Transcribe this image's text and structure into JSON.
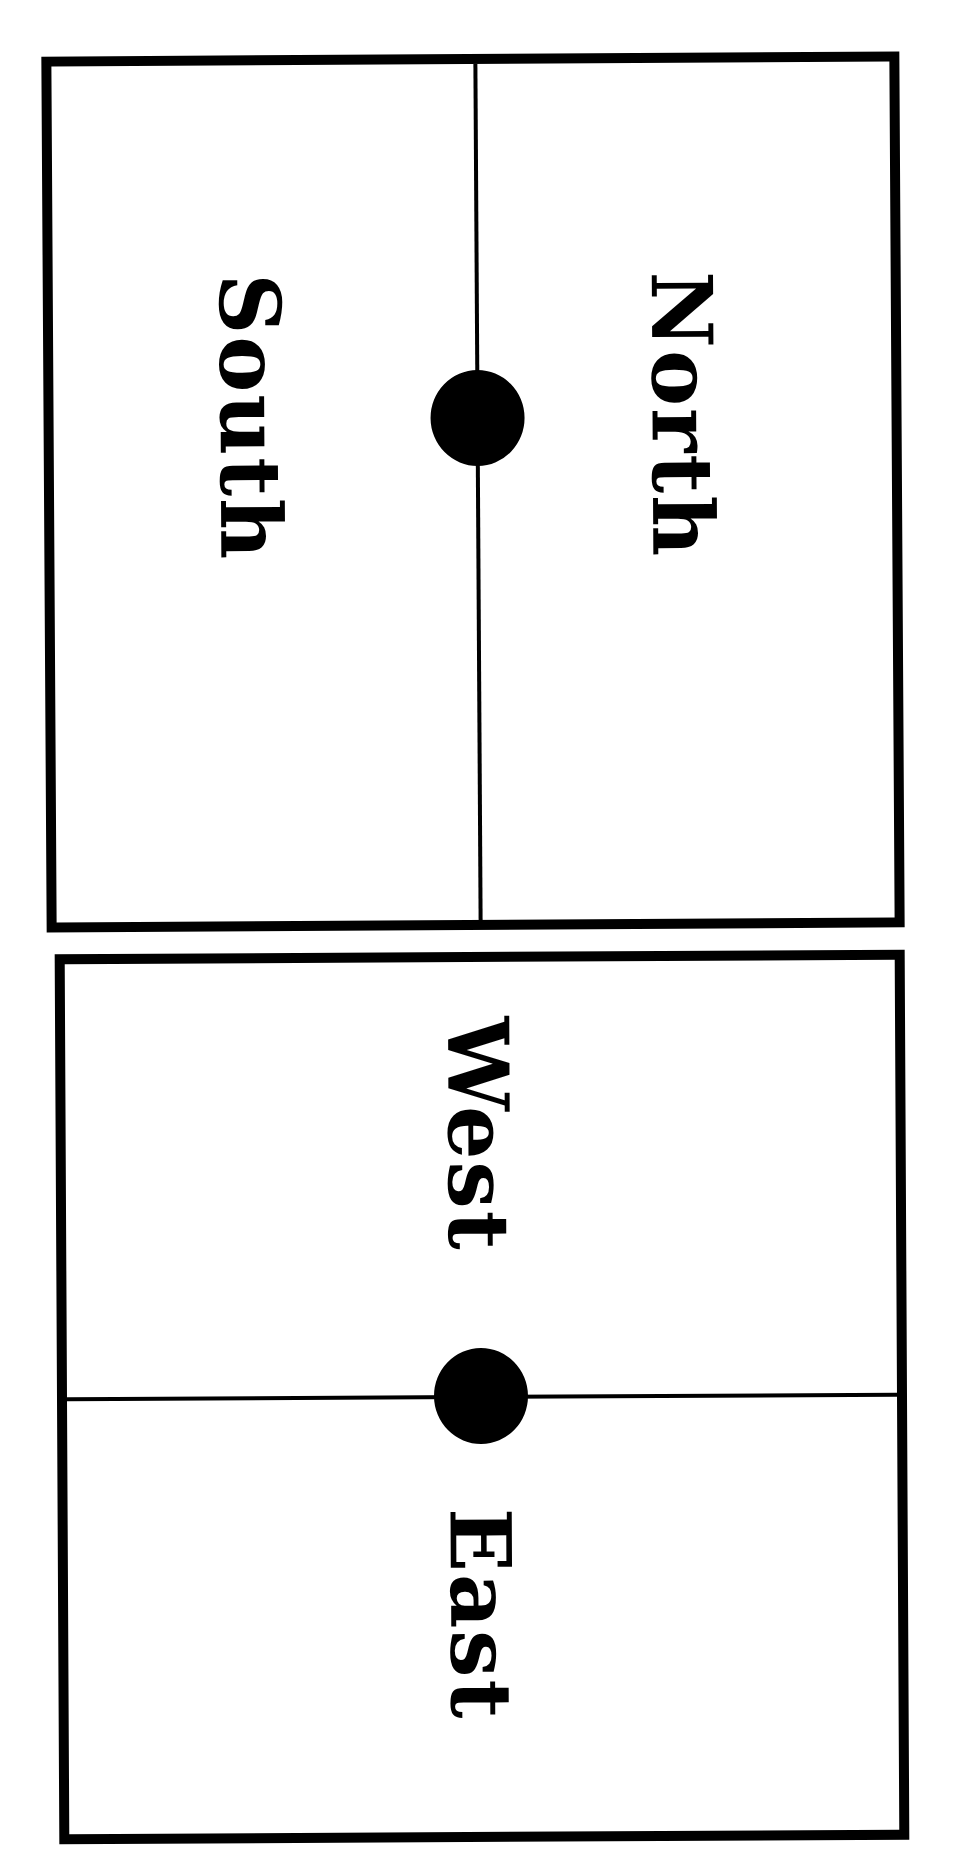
{
  "colors": {
    "line": "#000000",
    "background": "#ffffff",
    "dot": "#000000"
  },
  "cards": {
    "north_south": {
      "left_label": "South",
      "right_label": "North",
      "divider_orientation": "vertical",
      "center_marker": "filled-circle"
    },
    "west_east": {
      "top_label": "West",
      "bottom_label": "East",
      "divider_orientation": "horizontal",
      "center_marker": "filled-circle"
    }
  },
  "text_orientation": "rotated 90 degrees clockwise"
}
